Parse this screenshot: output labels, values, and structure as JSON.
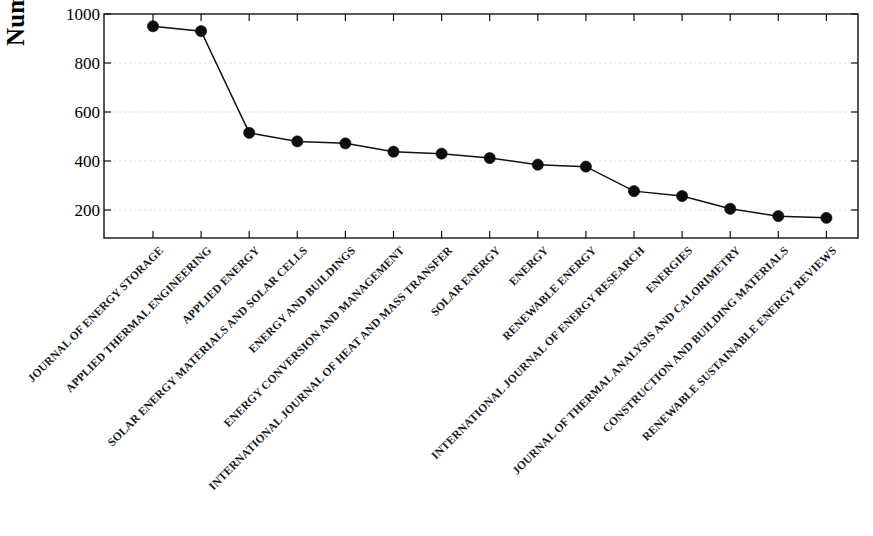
{
  "chart_data": {
    "type": "line",
    "title": "",
    "subtitle": "",
    "xlabel": "",
    "ylabel": "Number of Publication",
    "ylim": [
      150,
      1000
    ],
    "yticks": [
      200,
      400,
      600,
      800,
      1000
    ],
    "ytick_labels": [
      "200",
      "400",
      "600",
      "800",
      "1000"
    ],
    "grid": true,
    "grid_axis": "y",
    "legend": null,
    "marker": "filled-circle",
    "line_color": "#111111",
    "marker_color": "#0d0d0d",
    "categories": [
      "JOURNAL OF ENERGY STORAGE",
      "APPLIED THERMAL ENGINEERING",
      "APPLIED ENERGY",
      "SOLAR ENERGY MATERIALS AND SOLAR CELLS",
      "ENERGY AND BUILDINGS",
      "ENERGY CONVERSION AND MANAGEMENT",
      "INTERNATIONAL JOURNAL OF HEAT AND MASS TRANSFER",
      "SOLAR ENERGY",
      "ENERGY",
      "RENEWABLE ENERGY",
      "INTERNATIONAL JOURNAL OF ENERGY RESEARCH",
      "ENERGIES",
      "JOURNAL OF THERMAL ANALYSIS AND CALORIMETRY",
      "CONSTRUCTION AND BUILDING MATERIALS",
      "RENEWABLE SUSTAINABLE ENERGY REVIEWS"
    ],
    "values": [
      950,
      930,
      515,
      480,
      472,
      438,
      430,
      412,
      385,
      377,
      277,
      257,
      205,
      175,
      168
    ]
  }
}
